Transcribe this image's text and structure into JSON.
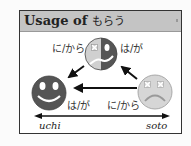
{
  "title": {
    "prefix": "Usage of",
    "verb": "もらう"
  },
  "labels": {
    "top_left": "に/から",
    "top_right": "は/が",
    "bottom_left": "は/が",
    "bottom_right": "に/から"
  },
  "axis": {
    "left": "uchi",
    "right": "soto"
  },
  "faces": [
    {
      "name": "top-face",
      "expression": "half-happy-half-upset",
      "colors": [
        "#d0d0d0",
        "#555555"
      ]
    },
    {
      "name": "left-face",
      "expression": "happy",
      "color": "#555555"
    },
    {
      "name": "right-face",
      "expression": "sad",
      "color": "#d6d6d6"
    }
  ],
  "colors": {
    "header": "#c4c4c4",
    "dark_face": "#555555",
    "light_face": "#d6d6d6",
    "arrow": "#111111"
  }
}
